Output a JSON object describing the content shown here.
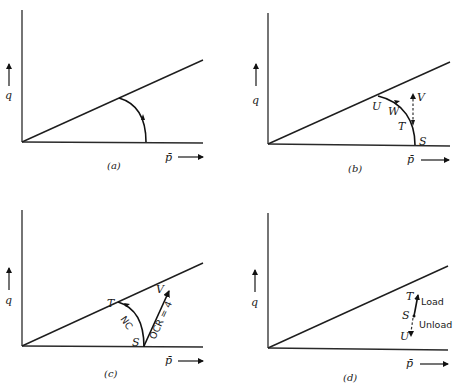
{
  "figure": {
    "axis_labels": {
      "y": "q",
      "x": "p̄"
    },
    "panels": [
      {
        "id": "a",
        "caption": "(a)",
        "labels": []
      },
      {
        "id": "b",
        "caption": "(b)",
        "labels": {
          "U": "U",
          "W": "W",
          "T": "T",
          "V": "V",
          "S": "S"
        }
      },
      {
        "id": "c",
        "caption": "(c)",
        "labels": {
          "T": "T",
          "V": "V",
          "S": "S",
          "nc": "NC",
          "ocr": "OCR = 4"
        }
      },
      {
        "id": "d",
        "caption": "(d)",
        "labels": {
          "T": "T",
          "S": "S",
          "U": "U",
          "load": "Load",
          "unload": "Unload"
        }
      }
    ]
  }
}
